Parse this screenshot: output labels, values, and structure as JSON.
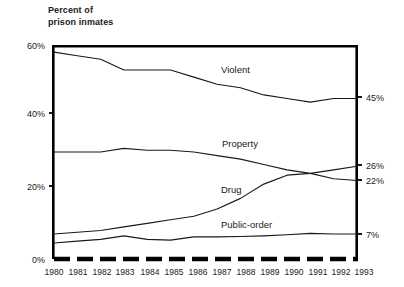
{
  "chart_data": {
    "type": "line",
    "xlabel": "",
    "ylabel": "Percent of prison inmates",
    "x": [
      1980,
      1981,
      1982,
      1983,
      1984,
      1985,
      1986,
      1987,
      1988,
      1989,
      1990,
      1991,
      1992,
      1993
    ],
    "categories": [
      "1980",
      "1981",
      "1982",
      "1983",
      "1984",
      "1985",
      "1986",
      "1987",
      "1988",
      "1989",
      "1990",
      "1991",
      "1992",
      "1993"
    ],
    "ylim": [
      0,
      60
    ],
    "xlim": [
      1980,
      1993
    ],
    "yticks": [
      0,
      20,
      40,
      60
    ],
    "ytick_labels": [
      "0%",
      "20%",
      "40%",
      "60%"
    ],
    "grid": false,
    "legend_position": "inline-labels",
    "series": [
      {
        "name": "Violent",
        "label": "Violent",
        "end_value_label": "45%",
        "values": [
          58,
          57,
          56,
          53,
          53,
          53,
          51,
          49,
          48,
          46,
          45,
          44,
          45,
          45
        ]
      },
      {
        "name": "Property",
        "label": "Property",
        "end_value_label": "22%",
        "values": [
          30,
          30,
          30,
          31,
          30.5,
          30.5,
          30,
          29,
          28,
          26.5,
          25,
          24,
          22.5,
          22
        ]
      },
      {
        "name": "Drug",
        "label": "Drug",
        "end_value_label": "26%",
        "values": [
          7,
          7.5,
          8,
          9,
          10,
          11,
          12,
          14,
          17,
          21,
          23.5,
          24,
          25,
          26
        ]
      },
      {
        "name": "Public-order",
        "label": "Public-order",
        "end_value_label": "7%",
        "values": [
          4.5,
          5,
          5.5,
          6.5,
          5.5,
          5.3,
          6.2,
          6.2,
          6.3,
          6.5,
          6.8,
          7.2,
          7,
          7
        ]
      }
    ]
  },
  "axis": {
    "y_title_line1": "Percent of",
    "y_title_line2": "prison inmates",
    "y_ticks": [
      "60%",
      "40%",
      "20%",
      "0%"
    ],
    "x_ticks": [
      "1980",
      "1981",
      "1982",
      "1983",
      "1984",
      "1985",
      "1986",
      "1987",
      "1988",
      "1989",
      "1990",
      "1991",
      "1992",
      "1993"
    ]
  },
  "end_labels": {
    "violent": "45%",
    "drug": "26%",
    "property": "22%",
    "public_order": "7%"
  },
  "series_labels": {
    "violent": "Violent",
    "property": "Property",
    "drug": "Drug",
    "public_order": "Public-order"
  },
  "colors": {
    "line": "#1a1a1a",
    "frame": "#000000",
    "background": "#ffffff"
  }
}
